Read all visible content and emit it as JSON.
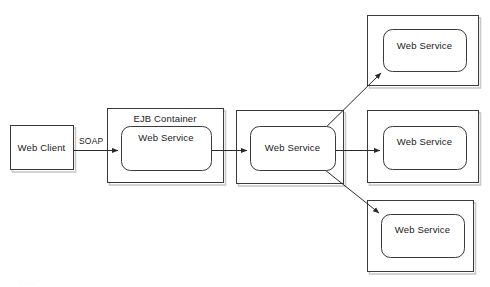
{
  "diagram": {
    "background_color": "#ffffff",
    "stroke_color": "#3a3a3a",
    "shadow_color": "#c8c8c8",
    "text_color": "#1a1a1a",
    "nodes": [
      {
        "id": "web-client",
        "label": "Web Client",
        "shape": "rectangle",
        "x": 10,
        "y": 125,
        "width": 63,
        "height": 44
      },
      {
        "id": "ejb-container",
        "label": "EJB Container",
        "shape": "rectangle-container",
        "x": 107,
        "y": 108,
        "width": 116,
        "height": 74
      },
      {
        "id": "ejb-web-service",
        "label": "Web Service",
        "shape": "rounded-rectangle",
        "x": 121,
        "y": 126,
        "width": 90,
        "height": 44
      },
      {
        "id": "mid-container",
        "label": "",
        "shape": "rectangle-container",
        "x": 236,
        "y": 110,
        "width": 107,
        "height": 73
      },
      {
        "id": "mid-web-service",
        "label": "Web Service",
        "shape": "rounded-rectangle",
        "x": 250,
        "y": 126,
        "width": 85,
        "height": 44
      },
      {
        "id": "top-right-container",
        "label": "",
        "shape": "rectangle-container",
        "x": 367,
        "y": 15,
        "width": 111,
        "height": 70
      },
      {
        "id": "top-right-web-service",
        "label": "Web Service",
        "shape": "rounded-rectangle",
        "x": 383,
        "y": 29,
        "width": 83,
        "height": 42
      },
      {
        "id": "mid-right-container",
        "label": "",
        "shape": "rectangle-container",
        "x": 367,
        "y": 110,
        "width": 111,
        "height": 72
      },
      {
        "id": "mid-right-web-service",
        "label": "Web Service",
        "shape": "rounded-rectangle",
        "x": 383,
        "y": 126,
        "width": 83,
        "height": 43
      },
      {
        "id": "bottom-right-container",
        "label": "",
        "shape": "rectangle-container",
        "x": 367,
        "y": 200,
        "width": 106,
        "height": 71
      },
      {
        "id": "bottom-right-web-service",
        "label": "Web Service",
        "shape": "rounded-rectangle",
        "x": 381,
        "y": 214,
        "width": 83,
        "height": 43
      }
    ],
    "edges": [
      {
        "id": "client-to-ejb",
        "label": "SOAP",
        "from": "web-client",
        "to": "ejb-web-service",
        "x1": 73,
        "y1": 150,
        "x2": 120,
        "y2": 150,
        "label_x": 80,
        "label_y": 137
      },
      {
        "id": "ejb-to-mid",
        "label": "",
        "from": "ejb-web-service",
        "to": "mid-web-service",
        "x1": 211,
        "y1": 150,
        "x2": 249,
        "y2": 150
      },
      {
        "id": "mid-to-top-right",
        "label": "",
        "from": "mid-web-service",
        "to": "top-right-web-service",
        "x1": 312,
        "y1": 141,
        "x2": 384,
        "y2": 71
      },
      {
        "id": "mid-to-mid-right",
        "label": "",
        "from": "mid-web-service",
        "to": "mid-right-web-service",
        "x1": 335,
        "y1": 150,
        "x2": 382,
        "y2": 150
      },
      {
        "id": "mid-to-bottom-right",
        "label": "",
        "from": "mid-web-service",
        "to": "bottom-right-web-service",
        "x1": 314,
        "y1": 160,
        "x2": 382,
        "y2": 215
      }
    ],
    "labels": {
      "ejb_container_title": "EJB Container",
      "ejb_container_title_x": 133,
      "ejb_container_title_y": 113
    },
    "bottom_artifact_text": "SOAP"
  }
}
